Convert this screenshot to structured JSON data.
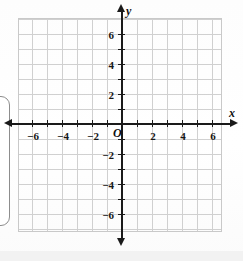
{
  "figure": {
    "kind": "coordinate-plane",
    "origin_label": "O",
    "x_axis_label": "x",
    "y_axis_label": "y"
  },
  "colors": {
    "grid": "#c9c9c9",
    "axis": "#1a1a1a",
    "text": "#111111",
    "callout_border": "#8d8d8d",
    "page_background": "#ffffff"
  },
  "chart_data": {
    "type": "scatter",
    "title": "",
    "xlabel": "x",
    "ylabel": "y",
    "xlim": [
      -7,
      7
    ],
    "ylim": [
      -7,
      7
    ],
    "grid": true,
    "legend": "none",
    "x_tick_labels": [
      "−6",
      "−4",
      "−2",
      "2",
      "4",
      "6"
    ],
    "x_tick_values": [
      -6,
      -4,
      -2,
      2,
      4,
      6
    ],
    "y_tick_labels": [
      "6",
      "4",
      "2",
      "−2",
      "−4",
      "−6"
    ],
    "y_tick_values": [
      6,
      4,
      2,
      -2,
      -4,
      -6
    ],
    "minor_tick_step": 1,
    "series": [
      {
        "name": "plotted-points",
        "x": [],
        "y": []
      }
    ]
  },
  "x_ticks": [
    {
      "value": -6,
      "label": "−6",
      "px": 32
    },
    {
      "value": -5,
      "label": "",
      "px": 47
    },
    {
      "value": -4,
      "label": "−4",
      "px": 62
    },
    {
      "value": -3,
      "label": "",
      "px": 77
    },
    {
      "value": -2,
      "label": "−2",
      "px": 92
    },
    {
      "value": -1,
      "label": "",
      "px": 107
    },
    {
      "value": 1,
      "label": "",
      "px": 137
    },
    {
      "value": 2,
      "label": "2",
      "px": 152
    },
    {
      "value": 3,
      "label": "",
      "px": 167
    },
    {
      "value": 4,
      "label": "4",
      "px": 182
    },
    {
      "value": 5,
      "label": "",
      "px": 197
    },
    {
      "value": 6,
      "label": "6",
      "px": 212
    }
  ],
  "y_ticks": [
    {
      "value": 6,
      "label": "6",
      "px": 34
    },
    {
      "value": 5,
      "label": "",
      "px": 49
    },
    {
      "value": 4,
      "label": "4",
      "px": 64
    },
    {
      "value": 3,
      "label": "",
      "px": 79
    },
    {
      "value": 2,
      "label": "2",
      "px": 94
    },
    {
      "value": 1,
      "label": "",
      "px": 109
    },
    {
      "value": -1,
      "label": "",
      "px": 139
    },
    {
      "value": -2,
      "label": "−2",
      "px": 154
    },
    {
      "value": -3,
      "label": "",
      "px": 169
    },
    {
      "value": -4,
      "label": "−4",
      "px": 184
    },
    {
      "value": -5,
      "label": "",
      "px": 199
    },
    {
      "value": -6,
      "label": "−6",
      "px": 214
    }
  ]
}
